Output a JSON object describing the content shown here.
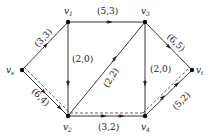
{
  "diagram": {
    "type": "network-flow-graph",
    "nodes": [
      {
        "id": "vs",
        "label": "v",
        "sub": "s",
        "x": 22,
        "y": 70
      },
      {
        "id": "v1",
        "label": "v",
        "sub": "1",
        "x": 68,
        "y": 22
      },
      {
        "id": "v3",
        "label": "v",
        "sub": "3",
        "x": 145,
        "y": 22
      },
      {
        "id": "v2",
        "label": "v",
        "sub": "2",
        "x": 68,
        "y": 116
      },
      {
        "id": "v4",
        "label": "v",
        "sub": "4",
        "x": 145,
        "y": 116
      },
      {
        "id": "vt",
        "label": "v",
        "sub": "t",
        "x": 192,
        "y": 70
      }
    ],
    "edges": [
      {
        "from": "vs",
        "to": "v1",
        "label": "(3,3)",
        "dashed_path": false
      },
      {
        "from": "v1",
        "to": "v3",
        "label": "(5,3)",
        "dashed_path": false
      },
      {
        "from": "v1",
        "to": "v2",
        "label": "(2,0)",
        "dashed_path": false
      },
      {
        "from": "vs",
        "to": "v2",
        "label": "(6,4)",
        "dashed_path": true
      },
      {
        "from": "v2",
        "to": "v3",
        "label": "(2,2)",
        "dashed_path": false
      },
      {
        "from": "v2",
        "to": "v4",
        "label": "(3,2)",
        "dashed_path": true
      },
      {
        "from": "v3",
        "to": "v4",
        "label": "(2,0)",
        "dashed_path": false
      },
      {
        "from": "v3",
        "to": "vt",
        "label": "(6,5)",
        "dashed_path": false
      },
      {
        "from": "v4",
        "to": "vt",
        "label": "(5,2)",
        "dashed_path": true
      }
    ],
    "colors": {
      "line": "#222222",
      "background": "#ffffff"
    }
  }
}
